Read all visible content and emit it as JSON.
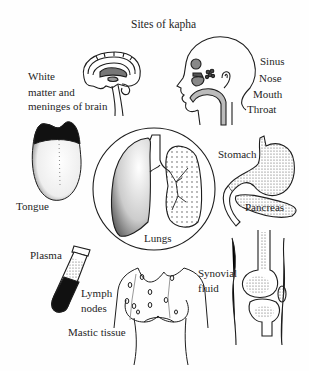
{
  "title": "Sites of kapha",
  "labels": {
    "brain": [
      "White",
      "matter and",
      "meninges of brain"
    ],
    "head": [
      "Sinus",
      "Nose",
      "Mouth",
      "Throat"
    ],
    "tongue": "Tongue",
    "lungs": "Lungs",
    "stomach": "Stomach",
    "pancreas": "Pancreas",
    "plasma": "Plasma",
    "lymph": [
      "Lymph",
      "nodes"
    ],
    "mastic": "Mastic tissue",
    "synovial": [
      "Synovial",
      "fluid"
    ]
  },
  "illustrations": [
    "brain-icon",
    "head-profile-icon",
    "tongue-icon",
    "lungs-icon",
    "stomach-pancreas-icon",
    "test-tube-icon",
    "chest-icon",
    "knee-joint-icon"
  ],
  "colors": {
    "ink": "#1e1e1e",
    "background": "#fefefe",
    "fill_dark": "#111111",
    "stipple": "#555555"
  }
}
